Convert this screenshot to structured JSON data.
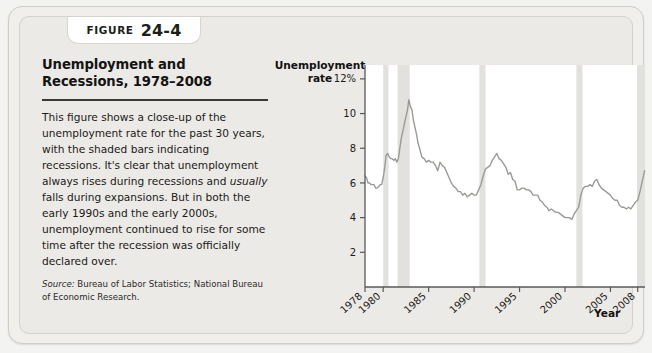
{
  "figure": {
    "tab_word": "Figure",
    "tab_number": "24-4",
    "title": "Unemployment and Recessions, 1978–2008",
    "body_part1": "This figure shows a close-up of the unemployment rate for the past 30 years, with the shaded bars indicating recessions. It's clear that unemployment always rises during recessions and ",
    "body_emphasis": "usually",
    "body_part2": " falls during expansions. But in both the early 1990s and the early 2000s, unemployment continued to rise for some time after the recession was officially declared over.",
    "source_label": "Source:",
    "source_text": " Bureau of Labor Statistics; National Bureau of Economic Research."
  },
  "chart_data": {
    "type": "line",
    "title": "Unemployment and Recessions, 1978–2008",
    "xlabel": "Year",
    "ylabel": "Unemployment rate",
    "ylabel_line1": "Unemployment",
    "ylabel_line2": "rate",
    "xlim": [
      1978,
      2008.8
    ],
    "ylim": [
      0,
      12.8
    ],
    "grid": false,
    "legend": "none",
    "line_color": "#9a9a96",
    "recession_band_color": "#e2e1de",
    "axis_color": "#58585a",
    "yticks": [
      2,
      4,
      6,
      8,
      10,
      12
    ],
    "ytick_labels": [
      "2",
      "4",
      "6",
      "8",
      "10",
      "12%"
    ],
    "xticks": [
      1978,
      1980,
      1985,
      1990,
      1995,
      2000,
      2005,
      2008
    ],
    "xtick_labels": [
      "1978",
      "1980",
      "1985",
      "1990",
      "1995",
      "2000",
      "2005",
      "2008"
    ],
    "recessions": [
      {
        "start": 1980.0,
        "end": 1980.58,
        "label": "Jan 1980 – Jul 1980"
      },
      {
        "start": 1981.58,
        "end": 1982.92,
        "label": "Jul 1981 – Nov 1982"
      },
      {
        "start": 1990.58,
        "end": 1991.25,
        "label": "Jul 1990 – Mar 1991"
      },
      {
        "start": 2001.25,
        "end": 2001.92,
        "label": "Mar 2001 – Nov 2001"
      },
      {
        "start": 2007.92,
        "end": 2008.8,
        "label": "Dec 2007 –"
      }
    ],
    "series": [
      {
        "name": "Unemployment rate",
        "x": [
          1978.0,
          1978.17,
          1978.33,
          1978.5,
          1978.67,
          1978.83,
          1979.0,
          1979.17,
          1979.33,
          1979.5,
          1979.67,
          1979.83,
          1980.0,
          1980.17,
          1980.33,
          1980.5,
          1980.67,
          1980.83,
          1981.0,
          1981.17,
          1981.33,
          1981.5,
          1981.67,
          1981.83,
          1982.0,
          1982.17,
          1982.33,
          1982.5,
          1982.67,
          1982.83,
          1983.0,
          1983.17,
          1983.33,
          1983.5,
          1983.67,
          1983.83,
          1984.0,
          1984.25,
          1984.5,
          1984.75,
          1985.0,
          1985.25,
          1985.5,
          1985.75,
          1986.0,
          1986.25,
          1986.5,
          1986.75,
          1987.0,
          1987.25,
          1987.5,
          1987.75,
          1988.0,
          1988.25,
          1988.5,
          1988.75,
          1989.0,
          1989.25,
          1989.5,
          1989.75,
          1990.0,
          1990.25,
          1990.5,
          1990.75,
          1991.0,
          1991.25,
          1991.5,
          1991.75,
          1992.0,
          1992.25,
          1992.5,
          1992.75,
          1993.0,
          1993.25,
          1993.5,
          1993.75,
          1994.0,
          1994.25,
          1994.5,
          1994.75,
          1995.0,
          1995.25,
          1995.5,
          1995.75,
          1996.0,
          1996.25,
          1996.5,
          1996.75,
          1997.0,
          1997.25,
          1997.5,
          1997.75,
          1998.0,
          1998.25,
          1998.5,
          1998.75,
          1999.0,
          1999.25,
          1999.5,
          1999.75,
          2000.0,
          2000.25,
          2000.5,
          2000.75,
          2001.0,
          2001.25,
          2001.5,
          2001.75,
          2002.0,
          2002.25,
          2002.5,
          2002.75,
          2003.0,
          2003.25,
          2003.5,
          2003.75,
          2004.0,
          2004.25,
          2004.5,
          2004.75,
          2005.0,
          2005.25,
          2005.5,
          2005.75,
          2006.0,
          2006.25,
          2006.5,
          2006.75,
          2007.0,
          2007.25,
          2007.5,
          2007.75,
          2008.0,
          2008.25,
          2008.5,
          2008.75
        ],
        "values": [
          6.4,
          6.3,
          6.0,
          6.0,
          5.9,
          5.9,
          5.9,
          5.7,
          5.7,
          5.8,
          5.9,
          5.9,
          6.3,
          6.9,
          7.6,
          7.7,
          7.5,
          7.4,
          7.4,
          7.3,
          7.4,
          7.2,
          7.4,
          8.0,
          8.6,
          9.0,
          9.4,
          9.8,
          10.2,
          10.8,
          10.4,
          10.2,
          9.6,
          9.2,
          8.8,
          8.3,
          8.0,
          7.5,
          7.4,
          7.2,
          7.3,
          7.2,
          7.2,
          7.0,
          6.7,
          7.2,
          7.0,
          6.9,
          6.6,
          6.3,
          6.0,
          5.8,
          5.7,
          5.5,
          5.5,
          5.3,
          5.4,
          5.2,
          5.3,
          5.4,
          5.3,
          5.3,
          5.6,
          5.9,
          6.4,
          6.8,
          6.9,
          7.0,
          7.3,
          7.5,
          7.7,
          7.4,
          7.3,
          7.1,
          6.9,
          6.5,
          6.6,
          6.2,
          6.1,
          5.6,
          5.6,
          5.7,
          5.7,
          5.6,
          5.6,
          5.5,
          5.3,
          5.3,
          5.3,
          5.0,
          4.9,
          4.7,
          4.6,
          4.4,
          4.5,
          4.4,
          4.3,
          4.3,
          4.2,
          4.1,
          4.0,
          4.0,
          4.0,
          3.9,
          4.2,
          4.4,
          4.6,
          5.3,
          5.7,
          5.8,
          5.8,
          5.9,
          5.8,
          6.1,
          6.2,
          5.9,
          5.7,
          5.6,
          5.5,
          5.4,
          5.3,
          5.1,
          5.0,
          5.0,
          4.7,
          4.6,
          4.6,
          4.5,
          4.6,
          4.5,
          4.7,
          4.9,
          5.0,
          5.5,
          6.1,
          6.7
        ]
      }
    ]
  }
}
